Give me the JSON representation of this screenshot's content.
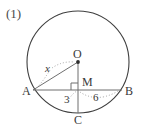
{
  "problem": {
    "number": "(1)"
  },
  "figure": {
    "type": "circle-geometry",
    "points": {
      "O": {
        "label": "O",
        "role": "center",
        "x": 78,
        "y": 62
      },
      "M": {
        "label": "M",
        "role": "foot-of-perpendicular",
        "x": 78,
        "y": 90
      },
      "A": {
        "label": "A",
        "role": "chord-endpoint-left",
        "x": 33,
        "y": 90
      },
      "B": {
        "label": "B",
        "role": "chord-endpoint-right",
        "x": 122,
        "y": 90
      },
      "C": {
        "label": "C",
        "role": "circle-bottom",
        "x": 78,
        "y": 113
      }
    },
    "circle": {
      "cx": 78,
      "cy": 62,
      "r": 51,
      "stroke_color": "#3f3f3f"
    },
    "segments": [
      {
        "name": "chord-AB",
        "from": "A",
        "to": "B",
        "style": "solid"
      },
      {
        "name": "radius-OA",
        "from": "O",
        "to": "A",
        "style": "solid"
      },
      {
        "name": "line-OC",
        "from": "O",
        "to": "C",
        "style": "solid"
      }
    ],
    "measures": {
      "radius_OA": "x",
      "segment_AM": "3",
      "segment_MB": "6"
    },
    "right_angle_at": "M",
    "colors": {
      "ink": "#3a3a3a",
      "circle_stroke": "#3f3f3f",
      "line_stroke": "#6b6b6b",
      "leader_dotted": "#8c8c8c",
      "background": "#ffffff"
    }
  }
}
